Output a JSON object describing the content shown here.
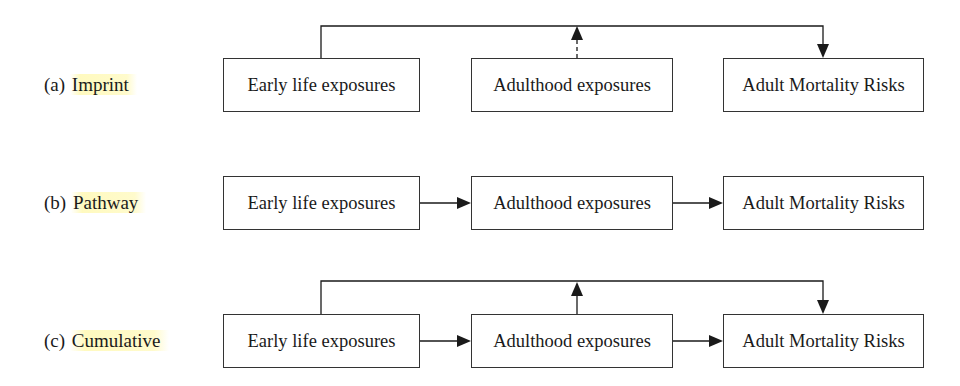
{
  "diagram": {
    "rows": [
      {
        "id": "a",
        "label_prefix": "(a) ",
        "label_name": "Imprint",
        "boxes": [
          "Early life exposures",
          "Adulthood exposures",
          "Adult Mortality Risks"
        ],
        "edges": [
          {
            "from": "Early life exposures",
            "to": "Adult Mortality Risks",
            "style": "solid",
            "route": "over-top"
          },
          {
            "from": "Adulthood exposures",
            "to": "top-line",
            "style": "dashed",
            "meaning": "weak/modifying"
          }
        ]
      },
      {
        "id": "b",
        "label_prefix": "(b) ",
        "label_name": "Pathway",
        "boxes": [
          "Early life exposures",
          "Adulthood exposures",
          "Adult Mortality Risks"
        ],
        "edges": [
          {
            "from": "Early life exposures",
            "to": "Adulthood exposures",
            "style": "solid"
          },
          {
            "from": "Adulthood exposures",
            "to": "Adult Mortality Risks",
            "style": "solid"
          }
        ]
      },
      {
        "id": "c",
        "label_prefix": "(c) ",
        "label_name": "Cumulative",
        "boxes": [
          "Early life exposures",
          "Adulthood exposures",
          "Adult Mortality Risks"
        ],
        "edges": [
          {
            "from": "Early life exposures",
            "to": "Adulthood exposures",
            "style": "solid"
          },
          {
            "from": "Adulthood exposures",
            "to": "Adult Mortality Risks",
            "style": "solid"
          },
          {
            "from": "Early life exposures",
            "to": "Adult Mortality Risks",
            "style": "solid",
            "route": "over-top"
          },
          {
            "from": "Adulthood exposures",
            "to": "top-line",
            "style": "solid"
          }
        ]
      }
    ],
    "colors": {
      "line": "#1a1a1a",
      "highlight": "#fff8aa"
    }
  }
}
